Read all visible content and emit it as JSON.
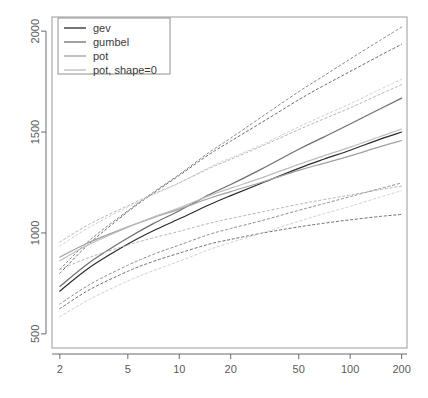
{
  "chart_data": {
    "type": "line",
    "title": "",
    "xlabel": "",
    "ylabel": "",
    "xscale": "log",
    "xlim": [
      1.8,
      215
    ],
    "ylim": [
      430,
      2070
    ],
    "grid": false,
    "legend_position": "top-left",
    "x_ticks": [
      2,
      5,
      10,
      20,
      50,
      100,
      200
    ],
    "x_tick_labels": [
      "2",
      "5",
      "10",
      "20",
      "50",
      "100",
      "200"
    ],
    "y_ticks": [
      500,
      1000,
      1500,
      2000
    ],
    "y_tick_labels": [
      "500",
      "1000",
      "1500",
      "2000"
    ],
    "legend": [
      {
        "label": "gev",
        "color": "#2b2b2b"
      },
      {
        "label": "gumbel",
        "color": "#6e6e6e"
      },
      {
        "label": "pot",
        "color": "#a0a0a0"
      },
      {
        "label": "pot, shape=0",
        "color": "#bdbdbd"
      }
    ],
    "x": [
      2,
      3,
      5,
      7,
      10,
      15,
      20,
      30,
      50,
      70,
      100,
      150,
      200
    ],
    "series": [
      {
        "name": "gev",
        "color": "#2b2b2b",
        "style": "solid",
        "values": [
          712,
          830,
          945,
          1010,
          1070,
          1140,
          1185,
          1245,
          1320,
          1365,
          1410,
          1465,
          1500
        ]
      },
      {
        "name": "gev-upper-ci",
        "color": "#6a6a6a",
        "style": "dashed",
        "values": [
          800,
          950,
          1105,
          1195,
          1285,
          1390,
          1455,
          1545,
          1660,
          1730,
          1800,
          1880,
          1935
        ]
      },
      {
        "name": "gev-lower-ci",
        "color": "#6a6a6a",
        "style": "dashed",
        "values": [
          625,
          720,
          810,
          858,
          900,
          945,
          968,
          998,
          1030,
          1048,
          1065,
          1082,
          1092
        ]
      },
      {
        "name": "gumbel",
        "color": "#6e6e6e",
        "style": "solid",
        "values": [
          735,
          855,
          975,
          1045,
          1110,
          1190,
          1240,
          1315,
          1415,
          1475,
          1540,
          1615,
          1668
        ]
      },
      {
        "name": "gumbel-upper-ci",
        "color": "#8a8a8a",
        "style": "dashed",
        "values": [
          820,
          965,
          1110,
          1200,
          1290,
          1400,
          1470,
          1572,
          1700,
          1778,
          1862,
          1955,
          2020
        ]
      },
      {
        "name": "gumbel-lower-ci",
        "color": "#8a8a8a",
        "style": "dashed",
        "values": [
          648,
          745,
          840,
          893,
          940,
          993,
          1022,
          1060,
          1112,
          1145,
          1180,
          1220,
          1248
        ]
      },
      {
        "name": "pot",
        "color": "#a0a0a0",
        "style": "solid",
        "values": [
          880,
          955,
          1030,
          1075,
          1118,
          1172,
          1205,
          1250,
          1310,
          1345,
          1382,
          1428,
          1458
        ]
      },
      {
        "name": "pot-upper-ci",
        "color": "#b4b4b4",
        "style": "dashed",
        "values": [
          955,
          1045,
          1135,
          1192,
          1248,
          1320,
          1365,
          1428,
          1512,
          1565,
          1620,
          1688,
          1735
        ]
      },
      {
        "name": "pot-lower-ci",
        "color": "#b4b4b4",
        "style": "dashed",
        "values": [
          818,
          880,
          940,
          975,
          1008,
          1048,
          1072,
          1103,
          1142,
          1165,
          1188,
          1215,
          1232
        ]
      },
      {
        "name": "pot-shape0",
        "color": "#bdbdbd",
        "style": "solid",
        "values": [
          862,
          945,
          1028,
          1078,
          1125,
          1185,
          1222,
          1272,
          1340,
          1382,
          1425,
          1478,
          1515
        ]
      },
      {
        "name": "pot-shape0-upper-ci",
        "color": "#cfcfcf",
        "style": "dashed",
        "values": [
          935,
          1030,
          1128,
          1188,
          1248,
          1325,
          1372,
          1435,
          1525,
          1582,
          1640,
          1712,
          1762
        ]
      },
      {
        "name": "pot-shape0-lower-ci",
        "color": "#cfcfcf",
        "style": "dashed",
        "values": [
          585,
          672,
          762,
          812,
          860,
          918,
          952,
          998,
          1058,
          1095,
          1132,
          1178,
          1210
        ]
      }
    ]
  }
}
